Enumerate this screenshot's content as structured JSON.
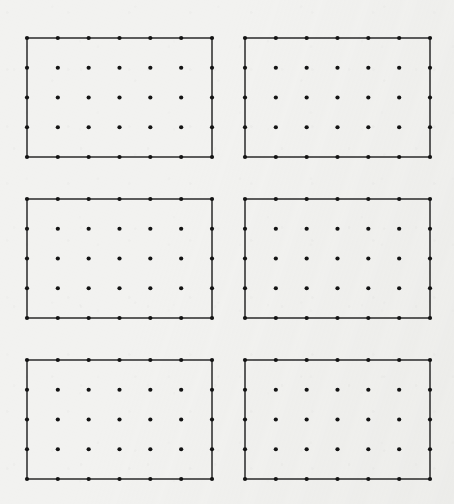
{
  "figure": {
    "background_color": "#f2f2f0",
    "canvas": {
      "width": 454,
      "height": 504
    }
  },
  "chart_data": {
    "type": "scatter",
    "title": "",
    "subtitle": "",
    "xlabel": "",
    "ylabel": "",
    "grid": false,
    "legend": null,
    "axis_visible": false,
    "tick_labels_x": [],
    "tick_labels_y": [],
    "panel_layout": {
      "rows": 3,
      "cols": 2,
      "total_panels": 6
    },
    "lattice": {
      "dot_columns": 7,
      "dot_rows": 5,
      "dots_per_panel": 35,
      "perimeter_dots_per_panel": 20,
      "interior_dots_per_panel": 15,
      "total_dots": 210,
      "dot_diameter_px": 4.2,
      "dot_color": "#141414",
      "edge_color": "#2a2a2a",
      "edge_width_px": 1.5,
      "col_spacing_px": 30.83,
      "row_spacing_px": 29.75,
      "panel_width_px": 185,
      "panel_height_px": 119
    },
    "panels": [
      {
        "id": "panel-top-left",
        "row": 1,
        "col": 1,
        "x0": 27,
        "y0": 38,
        "x1": 212,
        "y1": 157,
        "dot_columns": 7,
        "dot_rows": 5
      },
      {
        "id": "panel-top-right",
        "row": 1,
        "col": 2,
        "x0": 245,
        "y0": 38,
        "x1": 430,
        "y1": 157,
        "dot_columns": 7,
        "dot_rows": 5
      },
      {
        "id": "panel-middle-left",
        "row": 2,
        "col": 1,
        "x0": 27,
        "y0": 199,
        "x1": 212,
        "y1": 318,
        "dot_columns": 7,
        "dot_rows": 5
      },
      {
        "id": "panel-middle-right",
        "row": 2,
        "col": 2,
        "x0": 245,
        "y0": 199,
        "x1": 430,
        "y1": 318,
        "dot_columns": 7,
        "dot_rows": 5
      },
      {
        "id": "panel-bottom-left",
        "row": 3,
        "col": 1,
        "x0": 27,
        "y0": 360,
        "x1": 212,
        "y1": 479,
        "dot_columns": 7,
        "dot_rows": 5
      },
      {
        "id": "panel-bottom-right",
        "row": 3,
        "col": 2,
        "x0": 245,
        "y0": 360,
        "x1": 430,
        "y1": 479,
        "dot_columns": 7,
        "dot_rows": 5
      }
    ]
  }
}
